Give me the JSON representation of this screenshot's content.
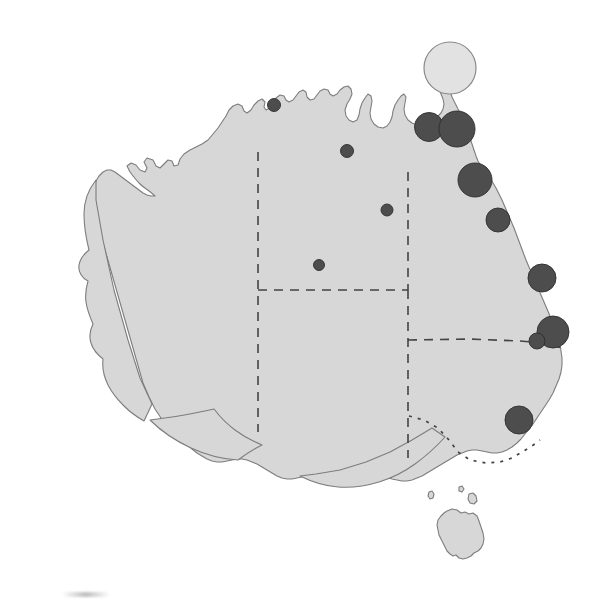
{
  "figure": {
    "background_color": "#ffffff",
    "land_fill_color": "#d7d7d7",
    "land_outline_color": "#7d7d7d",
    "symbol_dark_color": "#4d4d4d",
    "symbol_light_color": "#e2e2e2",
    "border_color": "#444444",
    "width": 615,
    "height": 604
  },
  "chart_data": {
    "type": "scatter",
    "subtitle": "",
    "xlabel": "",
    "ylabel": "",
    "projection": "Australia outline, state boundaries shown as dashed and dotted lines",
    "legend": [],
    "grid": false,
    "annotations": [],
    "symbol_encoding": "circle radius proportional to value; two shades used (dark filled, light filled)",
    "points": [
      {
        "id": "p1",
        "x": 450,
        "y": 68,
        "r": 26,
        "shade": "light",
        "region": "Torres Strait / north Cape York"
      },
      {
        "id": "p2",
        "x": 429,
        "y": 127,
        "r": 14.5,
        "shade": "dark",
        "region": "Gulf of Carpentaria coast"
      },
      {
        "id": "p3",
        "x": 457,
        "y": 129,
        "r": 18,
        "shade": "dark",
        "region": "Cape York Peninsula"
      },
      {
        "id": "p4",
        "x": 475,
        "y": 180,
        "r": 17,
        "shade": "dark",
        "region": "Far north Queensland coast"
      },
      {
        "id": "p5",
        "x": 498,
        "y": 220,
        "r": 12,
        "shade": "dark",
        "region": "North Queensland coast"
      },
      {
        "id": "p6",
        "x": 542,
        "y": 278,
        "r": 14,
        "shade": "dark",
        "region": "Central Queensland coast"
      },
      {
        "id": "p7",
        "x": 553,
        "y": 332,
        "r": 16,
        "shade": "dark",
        "region": "Southeast Queensland"
      },
      {
        "id": "p8",
        "x": 537,
        "y": 341,
        "r": 8,
        "shade": "dark",
        "region": "Southeast Queensland inland"
      },
      {
        "id": "p9",
        "x": 519,
        "y": 420,
        "r": 14,
        "shade": "dark",
        "region": "Central New South Wales coast"
      },
      {
        "id": "p10",
        "x": 274,
        "y": 105,
        "r": 6.5,
        "shade": "dark",
        "region": "Top End, Northern Territory"
      },
      {
        "id": "p11",
        "x": 347,
        "y": 151,
        "r": 6.5,
        "shade": "dark",
        "region": "Gulf coast, Northern Territory"
      },
      {
        "id": "p12",
        "x": 387,
        "y": 210,
        "r": 6,
        "shade": "dark",
        "region": "Northwest Queensland"
      },
      {
        "id": "p13",
        "x": 319,
        "y": 265,
        "r": 5.5,
        "shade": "dark",
        "region": "Central Australia"
      }
    ],
    "point_count": 13,
    "size_classes": [
      {
        "label": "large",
        "radius_px": 26
      },
      {
        "label": "medium",
        "radius_px": 14
      },
      {
        "label": "small",
        "radius_px": 6
      }
    ]
  }
}
